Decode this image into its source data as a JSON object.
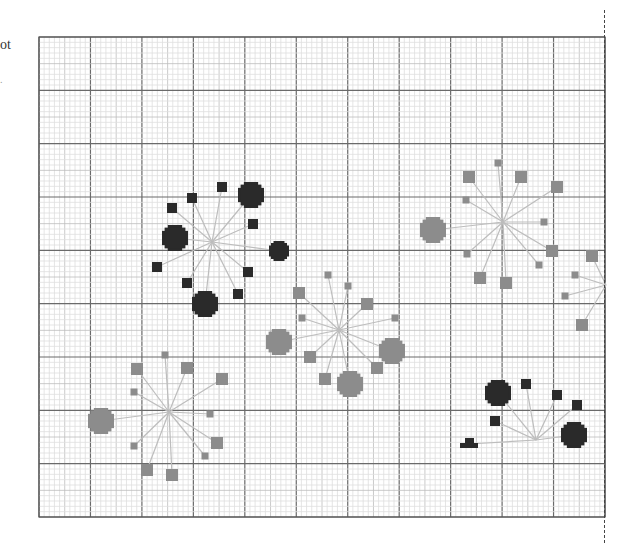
{
  "labels": {
    "clipped_title": "ot",
    "clipped_mark": "."
  },
  "grid": {
    "x0": 39,
    "y0": 37,
    "x1": 605,
    "y1": 517,
    "cols": 11,
    "rows": 9,
    "minor_divisions": 10,
    "colors": {
      "major": "#6a6a6a",
      "mid": "#bdbdbd",
      "minor": "#dedede",
      "border": "#555555"
    }
  },
  "colors": {
    "dark": "#2a2a2a",
    "gray": "#8c8c8c",
    "edge": "#bdbdbd"
  },
  "clusters": [
    {
      "id": "cluster-1",
      "color": "dark",
      "center": [
        212,
        242
      ],
      "nodes": [
        [
          222,
          187,
          "s"
        ],
        [
          251,
          195,
          "l"
        ],
        [
          192,
          198,
          "s"
        ],
        [
          172,
          208,
          "s"
        ],
        [
          253,
          224,
          "s"
        ],
        [
          175,
          238,
          "l"
        ],
        [
          279,
          251,
          "m"
        ],
        [
          157,
          267,
          "s"
        ],
        [
          248,
          272,
          "s"
        ],
        [
          187,
          283,
          "s"
        ],
        [
          238,
          294,
          "s"
        ],
        [
          205,
          304,
          "l"
        ]
      ]
    },
    {
      "id": "cluster-2",
      "color": "gray",
      "center": [
        339,
        330
      ],
      "nodes": [
        [
          328,
          275,
          "t"
        ],
        [
          348,
          286,
          "t"
        ],
        [
          299,
          293,
          "m"
        ],
        [
          367,
          304,
          "m"
        ],
        [
          302,
          318,
          "t"
        ],
        [
          395,
          318,
          "t"
        ],
        [
          279,
          342,
          "l"
        ],
        [
          392,
          351,
          "l"
        ],
        [
          310,
          357,
          "m"
        ],
        [
          377,
          368,
          "m"
        ],
        [
          325,
          379,
          "m"
        ],
        [
          350,
          384,
          "l"
        ]
      ]
    },
    {
      "id": "cluster-3",
      "color": "gray",
      "center": [
        503,
        222
      ],
      "nodes": [
        [
          498,
          163,
          "t"
        ],
        [
          469,
          177,
          "m"
        ],
        [
          521,
          177,
          "m"
        ],
        [
          557,
          187,
          "m"
        ],
        [
          466,
          200,
          "t"
        ],
        [
          544,
          222,
          "t"
        ],
        [
          433,
          230,
          "l"
        ],
        [
          552,
          251,
          "m"
        ],
        [
          467,
          254,
          "t"
        ],
        [
          539,
          265,
          "t"
        ],
        [
          480,
          278,
          "m"
        ],
        [
          506,
          283,
          "m"
        ]
      ]
    },
    {
      "id": "cluster-4",
      "color": "gray",
      "center": [
        606,
        285
      ],
      "nodes": [
        [
          592,
          256,
          "m"
        ],
        [
          575,
          275,
          "t"
        ],
        [
          565,
          296,
          "t"
        ],
        [
          582,
          325,
          "m"
        ]
      ]
    },
    {
      "id": "cluster-5",
      "color": "gray",
      "center": [
        169,
        412
      ],
      "nodes": [
        [
          165,
          355,
          "t"
        ],
        [
          137,
          369,
          "m"
        ],
        [
          187,
          368,
          "m"
        ],
        [
          222,
          379,
          "m"
        ],
        [
          134,
          392,
          "t"
        ],
        [
          210,
          414,
          "t"
        ],
        [
          101,
          421,
          "l"
        ],
        [
          217,
          443,
          "m"
        ],
        [
          134,
          446,
          "t"
        ],
        [
          205,
          456,
          "t"
        ],
        [
          147,
          470,
          "m"
        ],
        [
          172,
          475,
          "m"
        ]
      ]
    },
    {
      "id": "cluster-6",
      "color": "dark",
      "center": [
        536,
        440
      ],
      "nodes": [
        [
          498,
          393,
          "l"
        ],
        [
          526,
          384,
          "s"
        ],
        [
          557,
          395,
          "s"
        ],
        [
          577,
          405,
          "s"
        ],
        [
          495,
          421,
          "s"
        ],
        [
          574,
          435,
          "l"
        ],
        [
          469,
          444,
          "h"
        ]
      ]
    }
  ]
}
